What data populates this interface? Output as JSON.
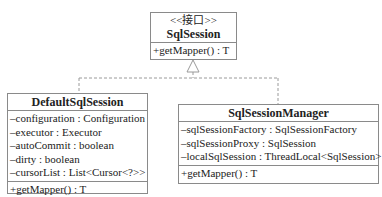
{
  "interface": {
    "stereotype": "<<接口>>",
    "name": "SqlSession",
    "methods": [
      "+getMapper() : T"
    ]
  },
  "classes": [
    {
      "name": "DefaultSqlSession",
      "attributes": [
        "–configuration : Configuration",
        "–executor : Executor",
        "–autoCommit : boolean",
        "–dirty : boolean",
        "–cursorList : List<Cursor<?>>"
      ],
      "methods": [
        "+getMapper() : T"
      ]
    },
    {
      "name": "SqlSessionManager",
      "attributes": [
        "–sqlSessionFactory : SqlSessionFactory",
        "–sqlSessionProxy : SqlSession",
        "–localSqlSession : ThreadLocal<SqlSession>"
      ],
      "methods": [
        "+getMapper() : T"
      ]
    }
  ],
  "relationships": [
    {
      "type": "realization",
      "from": "DefaultSqlSession",
      "to": "SqlSession"
    },
    {
      "type": "realization",
      "from": "SqlSessionManager",
      "to": "SqlSession"
    }
  ],
  "colors": {
    "border": "#8a8a8a",
    "connector": "#9a9a9a",
    "text": "#222222"
  }
}
